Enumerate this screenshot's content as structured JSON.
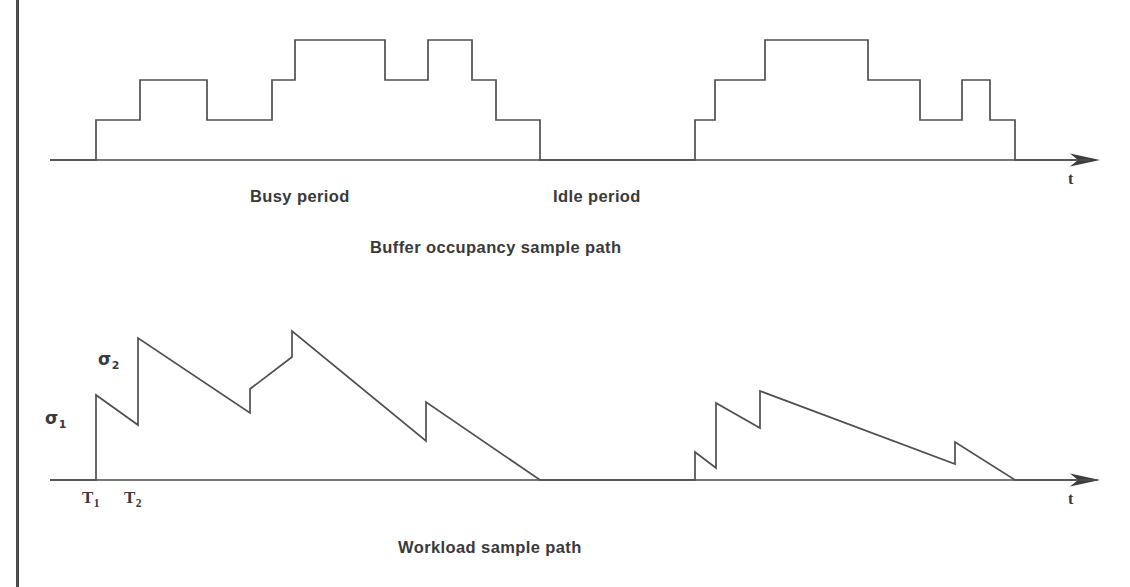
{
  "figure": {
    "background": "#ffffff",
    "ink_color": "#4f4f4f",
    "page_edge_color": "#3b3b3b"
  },
  "chart_data": [
    {
      "type": "line",
      "id": "buffer-occupancy",
      "title": "Buffer occupancy sample path",
      "subtitle": "",
      "xlabel": "t",
      "ylabel": "",
      "style": "staircase",
      "grid": false,
      "legend": "none",
      "xlim": [
        0,
        1130
      ],
      "ylim": [
        0,
        4
      ],
      "annotations": [
        {
          "text": "Busy period",
          "x": 250,
          "y": 198
        },
        {
          "text": "Idle period",
          "x": 553,
          "y": 198
        }
      ],
      "baseline_y": 160,
      "step_height": 40,
      "axis_start_x": 50,
      "axis_end_x": 1098,
      "steps": [
        {
          "x": 96,
          "level": 1
        },
        {
          "x": 140,
          "level": 2
        },
        {
          "x": 207,
          "level": 1
        },
        {
          "x": 272,
          "level": 2
        },
        {
          "x": 295,
          "level": 3
        },
        {
          "x": 385,
          "level": 2
        },
        {
          "x": 428,
          "level": 3
        },
        {
          "x": 472,
          "level": 2
        },
        {
          "x": 496,
          "level": 1
        },
        {
          "x": 540,
          "level": 0
        },
        {
          "x": 695,
          "level": 1
        },
        {
          "x": 715,
          "level": 2
        },
        {
          "x": 765,
          "level": 3
        },
        {
          "x": 868,
          "level": 2
        },
        {
          "x": 920,
          "level": 1
        },
        {
          "x": 962,
          "level": 2
        },
        {
          "x": 990,
          "level": 1
        },
        {
          "x": 1015,
          "level": 0
        }
      ]
    },
    {
      "type": "line",
      "id": "workload",
      "title": "Workload sample path",
      "subtitle": "",
      "xlabel": "t",
      "ylabel": "",
      "style": "sawtooth",
      "grid": false,
      "legend": "none",
      "xlim": [
        0,
        1130
      ],
      "ylim": [
        0,
        160
      ],
      "baseline_y": 480,
      "axis_start_x": 50,
      "axis_end_x": 1098,
      "annotations": [
        {
          "text": "σ",
          "sub": "1",
          "x": 46,
          "y": 409
        },
        {
          "text": "σ",
          "sub": "2",
          "x": 99,
          "y": 350
        },
        {
          "text": "T",
          "sub": "1",
          "x": 82,
          "y": 489
        },
        {
          "text": "T",
          "sub": "2",
          "x": 124,
          "y": 489
        }
      ],
      "vertices": [
        {
          "x": 50,
          "y": 480
        },
        {
          "x": 96,
          "y": 480
        },
        {
          "x": 96,
          "y": 395
        },
        {
          "x": 138,
          "y": 425
        },
        {
          "x": 138,
          "y": 338
        },
        {
          "x": 250,
          "y": 413
        },
        {
          "x": 250,
          "y": 389
        },
        {
          "x": 292,
          "y": 357
        },
        {
          "x": 292,
          "y": 331
        },
        {
          "x": 426,
          "y": 441
        },
        {
          "x": 426,
          "y": 402
        },
        {
          "x": 540,
          "y": 480
        },
        {
          "x": 695,
          "y": 480
        },
        {
          "x": 695,
          "y": 452
        },
        {
          "x": 716,
          "y": 468
        },
        {
          "x": 716,
          "y": 403
        },
        {
          "x": 760,
          "y": 428
        },
        {
          "x": 760,
          "y": 391
        },
        {
          "x": 955,
          "y": 464
        },
        {
          "x": 955,
          "y": 442
        },
        {
          "x": 1015,
          "y": 480
        },
        {
          "x": 1098,
          "y": 480
        }
      ]
    }
  ],
  "labels": {
    "busy_period": "Busy period",
    "idle_period": "Idle period",
    "caption_top": "Buffer occupancy sample path",
    "caption_bottom": "Workload sample path",
    "axis_t_top": "t",
    "axis_t_bottom": "t",
    "sigma1_sym": "σ",
    "sigma1_sub": "1",
    "sigma2_sym": "σ",
    "sigma2_sub": "2",
    "t1_sym": "T",
    "t1_sub": "1",
    "t2_sym": "T",
    "t2_sub": "2"
  }
}
